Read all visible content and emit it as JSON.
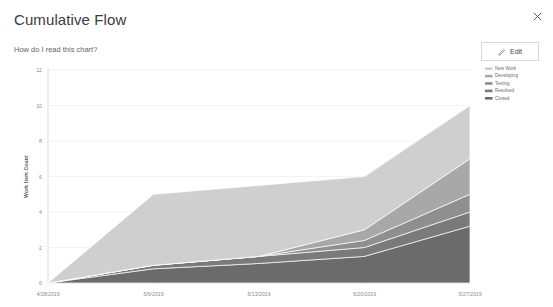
{
  "window": {
    "close_icon": "close-icon"
  },
  "header": {
    "title": "Cumulative Flow",
    "subtitle": "How do I read this chart?",
    "edit_label": "Edit",
    "edit_icon": "pencil-icon"
  },
  "chart_data": {
    "type": "area",
    "title": "Cumulative Flow",
    "xlabel": "",
    "ylabel": "Work Item Count",
    "ylim": [
      0,
      12
    ],
    "yticks": [
      0,
      2,
      4,
      6,
      8,
      10,
      12
    ],
    "ytick_labels": [
      "0",
      "2",
      "4",
      "6",
      "8",
      "10",
      "12"
    ],
    "grid": true,
    "legend_position": "top-right",
    "stacked": true,
    "x": [
      "4/28/2019",
      "5/6/2019",
      "5/13/2019",
      "5/20/2019",
      "5/27/2019"
    ],
    "xtick_labels": [
      "4/28/2019",
      "5/6/2019",
      "5/13/2019",
      "5/20/2019",
      "5/27/2019"
    ],
    "series": [
      {
        "name": "New Work",
        "color": "#cfcfcf",
        "values": [
          0,
          4,
          4,
          3,
          3
        ]
      },
      {
        "name": "Developing",
        "color": "#a8a8a8",
        "values": [
          0,
          0,
          0,
          0.6,
          2
        ]
      },
      {
        "name": "Testing",
        "color": "#8f8f8f",
        "values": [
          0,
          0,
          0,
          0.4,
          1
        ]
      },
      {
        "name": "Resolved",
        "color": "#7a7a7a",
        "values": [
          0,
          0.2,
          0.4,
          0.5,
          0.8
        ]
      },
      {
        "name": "Closed",
        "color": "#6b6b6b",
        "values": [
          0,
          0.8,
          1.1,
          1.5,
          3.2
        ]
      }
    ],
    "cumulative_totals": [
      0,
      5,
      5.5,
      6,
      10
    ]
  }
}
